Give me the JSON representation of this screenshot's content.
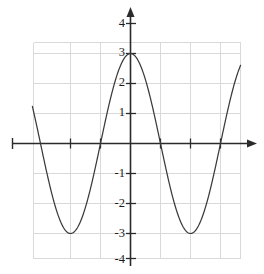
{
  "figure": {
    "kind": "coordinate-plane-graph",
    "background_color": "#ffffff",
    "grid_color": "#d9d9d9",
    "axis_color": "#2b2b2b",
    "curve_color": "#3a3a3a"
  },
  "y_axis": {
    "labels": [
      "4",
      "3",
      "2",
      "1",
      "-1",
      "-2",
      "-3",
      "-4"
    ],
    "label_values": [
      4,
      3,
      2,
      1,
      -1,
      -2,
      -3,
      -4
    ],
    "has_arrow_head": true
  },
  "x_axis": {
    "labels": [],
    "tick_values": [
      -2,
      -1,
      1,
      2,
      3
    ],
    "has_arrow_head": true
  },
  "chart_data": {
    "type": "line",
    "title": "",
    "xlabel": "",
    "ylabel": "",
    "grid": true,
    "legend": null,
    "xlim": [
      -3.27,
      3.67
    ],
    "ylim": [
      -4.0,
      4.4
    ],
    "xticks": [
      -3,
      -2,
      -1,
      0,
      1,
      2,
      3
    ],
    "yticks": [
      -4,
      -3,
      -2,
      -1,
      0,
      1,
      2,
      3,
      4
    ],
    "ytick_labels": [
      "-4",
      "-3",
      "-2",
      "-1",
      "",
      "1",
      "2",
      "3",
      "4"
    ],
    "series": [
      {
        "name": "y = 3cos(pi*x/2)",
        "amplitude": 3,
        "period": 4,
        "maxima": [
          [
            -4,
            3
          ],
          [
            0,
            3
          ],
          [
            4,
            3
          ]
        ],
        "minima": [
          [
            -2,
            -3
          ],
          [
            2,
            -3
          ]
        ],
        "zeros": [
          -3,
          -1,
          1,
          3
        ],
        "x": [
          -3.27,
          -3.15,
          -3.0,
          -2.85,
          -2.7,
          -2.55,
          -2.4,
          -2.25,
          -2.1,
          -2.0,
          -1.9,
          -1.75,
          -1.6,
          -1.45,
          -1.3,
          -1.15,
          -1.0,
          -0.85,
          -0.7,
          -0.55,
          -0.4,
          -0.25,
          -0.1,
          0,
          0.1,
          0.25,
          0.4,
          0.55,
          0.7,
          0.85,
          1.0,
          1.15,
          1.3,
          1.45,
          1.6,
          1.75,
          1.9,
          2.0,
          2.1,
          2.25,
          2.4,
          2.55,
          2.7,
          2.85,
          3.0,
          3.15,
          3.3,
          3.45,
          3.6,
          3.67
        ],
        "y": [
          1.23,
          0.7,
          0.0,
          -0.7,
          -1.34,
          -1.89,
          -2.33,
          -2.66,
          -2.88,
          -3.0,
          -2.95,
          -2.77,
          -2.49,
          -2.11,
          -1.66,
          -1.15,
          0.0,
          0.7,
          1.34,
          1.89,
          2.33,
          2.66,
          2.88,
          3.0,
          2.96,
          2.77,
          2.49,
          2.11,
          1.66,
          1.15,
          0.0,
          -0.7,
          -1.34,
          -1.89,
          -2.33,
          -2.66,
          -2.88,
          -3.0,
          -2.96,
          -2.77,
          -2.49,
          -2.11,
          -1.66,
          -1.15,
          0.0,
          0.7,
          1.34,
          1.89,
          2.33,
          2.55
        ]
      }
    ]
  }
}
